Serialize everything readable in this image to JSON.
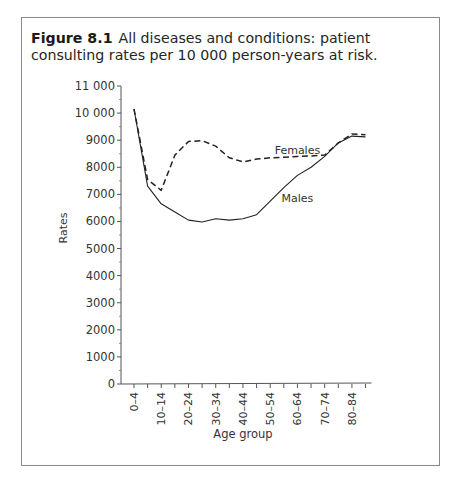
{
  "figure": {
    "label": "Figure 8.1",
    "caption": "All diseases and conditions: patient consulting rates per 10 000 person-years at risk."
  },
  "chart_data": {
    "type": "line",
    "xlabel": "Age group",
    "ylabel": "Rates",
    "ylim": [
      0,
      11000
    ],
    "yticks": [
      0,
      1000,
      2000,
      3000,
      4000,
      5000,
      6000,
      7000,
      8000,
      9000,
      10000,
      11000
    ],
    "ytick_labels": [
      "0",
      "1000",
      "2000",
      "3000",
      "4000",
      "5000",
      "6000",
      "7000",
      "8000",
      "9000",
      "10 000",
      "11 000"
    ],
    "categories": [
      "0–4",
      "5–9",
      "10–14",
      "15–19",
      "20–24",
      "25–29",
      "30–34",
      "35–39",
      "40–44",
      "45–49",
      "50–54",
      "55–59",
      "60–64",
      "65–69",
      "70–74",
      "75–79",
      "80–84",
      "85+"
    ],
    "xtick_labels_shown": [
      "0–4",
      "10–14",
      "20–24",
      "30–34",
      "40–44",
      "50–54",
      "60–64",
      "70–74",
      "80–84"
    ],
    "grid": false,
    "legend": "inline labels",
    "series": [
      {
        "name": "Females",
        "style": "dashed",
        "values": [
          10150,
          7550,
          7150,
          8450,
          8950,
          8980,
          8780,
          8350,
          8200,
          8300,
          8350,
          8370,
          8400,
          8420,
          8450,
          8900,
          9230,
          9200
        ]
      },
      {
        "name": "Males",
        "style": "solid",
        "values": [
          10150,
          7300,
          6650,
          6350,
          6050,
          5980,
          6100,
          6050,
          6100,
          6250,
          6750,
          7250,
          7700,
          8000,
          8400,
          8900,
          9150,
          9120
        ]
      }
    ],
    "annotations": [
      {
        "text": "Females",
        "near": "60–64",
        "value": 8650
      },
      {
        "text": "Males",
        "near": "60–64",
        "value": 6850
      }
    ]
  }
}
